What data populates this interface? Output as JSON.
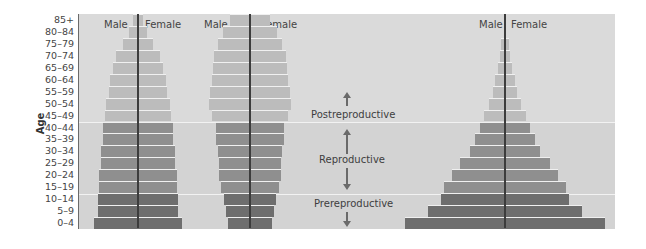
{
  "chart_data": {
    "type": "bar",
    "subtype": "population-pyramid",
    "title": "",
    "ylabel": "Age",
    "xlabel": "",
    "categories": [
      "0–4",
      "5–9",
      "10–14",
      "15–19",
      "20–24",
      "25–29",
      "30–34",
      "35–39",
      "40–44",
      "45–49",
      "50–54",
      "55–59",
      "60–64",
      "65–69",
      "70–74",
      "75–79",
      "80–84",
      "85+"
    ],
    "bands": [
      {
        "name": "Prereproductive",
        "ages": [
          "0–4",
          "5–9",
          "10–14"
        ],
        "color": "#6e6e6e"
      },
      {
        "name": "Reproductive",
        "ages": [
          "15–19",
          "20–24",
          "25–29",
          "30–34",
          "35–39",
          "40–44"
        ],
        "color": "#8f8f8f"
      },
      {
        "name": "Postreproductive",
        "ages": [
          "45–49",
          "50–54",
          "55–59",
          "60–64",
          "65–69",
          "70–74",
          "75–79",
          "80–84",
          "85+"
        ],
        "color": "#bcbcbc"
      }
    ],
    "pyramids": [
      {
        "name": "Pyramid 1 (stable)",
        "center_px": 137,
        "male_label": "Male",
        "female_label": "Female",
        "half_widths_px": [
          44,
          40,
          40,
          39,
          39,
          37,
          37,
          35,
          35,
          33,
          32,
          29,
          28,
          25,
          22,
          15,
          9,
          5
        ]
      },
      {
        "name": "Pyramid 2 (declining)",
        "center_px": 249,
        "male_label": "Male",
        "female_label": "Female",
        "half_widths_px": [
          22,
          24,
          26,
          29,
          31,
          31,
          32,
          34,
          34,
          38,
          41,
          40,
          38,
          37,
          36,
          32,
          27,
          20
        ]
      },
      {
        "name": "Pyramid 3 (expanding)",
        "center_px": 504,
        "male_label": "Male",
        "female_label": "Female",
        "half_widths_px": [
          100,
          77,
          64,
          61,
          53,
          45,
          35,
          30,
          25,
          21,
          16,
          12,
          10,
          7,
          5,
          4,
          0,
          0
        ]
      }
    ],
    "annotations": [
      "Postreproductive",
      "Reproductive",
      "Prereproductive"
    ],
    "grid": false,
    "legend": "none"
  },
  "labels": {
    "yaxis": "Age",
    "male": "Male",
    "female": "Female",
    "post": "Postreproductive",
    "repro": "Reproductive",
    "pre": "Prereproductive"
  }
}
